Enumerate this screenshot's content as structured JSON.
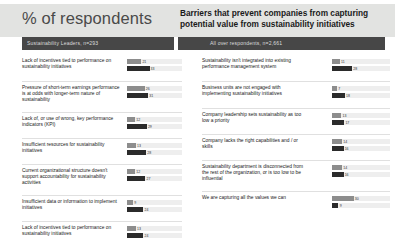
{
  "header": {
    "title_left": "% of respondents",
    "title_right": "Barriers that prevent companies from capturing potential value from sustainability initiatives",
    "subheader_left": "Sustainability Leaders, n=293",
    "subheader_right": "All over respondents, n=2,661"
  },
  "colors": {
    "header_band": "#e2e3e1",
    "subheader_bar": "#474747",
    "series_leaders": "#8d8d8d",
    "series_others": "#2b2b2b",
    "bar_track": "#eeeeee"
  },
  "chart_data": {
    "type": "bar",
    "title": "Barriers that prevent companies from capturing potential value from sustainability initiatives",
    "xlabel": "% of respondents",
    "ylabel": "",
    "xlim": [
      0,
      50
    ],
    "grid": false,
    "legend": [
      "Sustainability Leaders, n=293",
      "All over respondents, n=2,661"
    ],
    "legend_position": "column-headers",
    "columns": [
      {
        "header": "Sustainability Leaders, n=293",
        "categories": [
          "Lack of incentives tied to performance on sustainability initiatives",
          "Pressure of short-term earnings performance is at odds with longer-term nature of sustainability",
          "Lack of, or use of wrong, key performance indicators (KPI)",
          "Insufficient resources for sustainability initiatives",
          "Current organizational structure doesn't support accountability for sustainability activities",
          "Insufficient data or information to implement initiatives",
          "Lack of incentives tied to performance on sustainability initiatives"
        ],
        "series": [
          {
            "name": "Sustainability Leaders, n=293",
            "values": [
              21,
              26,
              12,
              13,
              12,
              9,
              13
            ]
          },
          {
            "name": "All over respondents, n=2,661",
            "values": [
              33,
              31,
              29,
              28,
              27,
              24,
              24
            ]
          }
        ]
      },
      {
        "header": "All over respondents, n=2,661",
        "categories": [
          "Sustainability isn't integrated into existing performance management system",
          "Business units are not engaged with implementing sustainability initiatives",
          "Company leadership sets sustainability as too low a priority",
          "Company lacks the right capabilities and / or skills",
          "Sustainability department is disconnected from the rest of the organization, or is too low to be influential",
          "We are capturing all the values we can"
        ],
        "series": [
          {
            "name": "Sustainability Leaders, n=293",
            "values": [
              11,
              7,
              13,
              14,
              14,
              30
            ]
          },
          {
            "name": "All over respondents, n=2,661",
            "values": [
              28,
              18,
              17,
              16,
              16,
              9
            ]
          }
        ]
      }
    ]
  }
}
